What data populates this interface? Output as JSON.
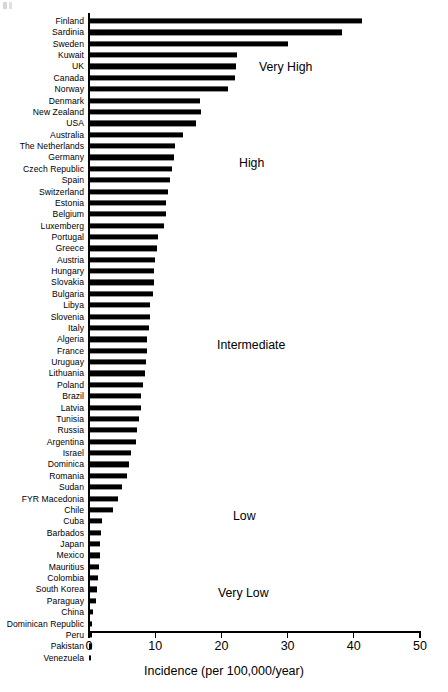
{
  "chart_data": {
    "type": "bar",
    "orientation": "horizontal",
    "title": "",
    "subtitle": "",
    "xlabel": "Incidence (per 100,000/year)",
    "ylabel": "",
    "xlim": [
      0,
      50
    ],
    "xticks": [
      0,
      10,
      20,
      30,
      40,
      50
    ],
    "xtick_labels": [
      "0",
      "10",
      "20",
      "30",
      "40",
      "50"
    ],
    "grid": false,
    "legend": "none",
    "bar_color": "#000000",
    "categories": [
      "Finland",
      "Sardinia",
      "Sweden",
      "Kuwait",
      "UK",
      "Canada",
      "Norway",
      "Denmark",
      "New Zealand",
      "USA",
      "Australia",
      "The Netherlands",
      "Germany",
      "Czech Republic",
      "Spain",
      "Switzerland",
      "Estonia",
      "Belgium",
      "Luxemberg",
      "Portugal",
      "Greece",
      "Austria",
      "Hungary",
      "Slovakia",
      "Bulgaria",
      "Libya",
      "Slovenia",
      "Italy",
      "Algeria",
      "France",
      "Uruguay",
      "Lithuania",
      "Poland",
      "Brazil",
      "Latvia",
      "Tunisia",
      "Russia",
      "Argentina",
      "Israel",
      "Dominica",
      "Romania",
      "Sudan",
      "FYR Macedonia",
      "Chile",
      "Cuba",
      "Barbados",
      "Japan",
      "Mexico",
      "Mauritius",
      "Colombia",
      "South Korea",
      "Paraguay",
      "China",
      "Dominican Republic",
      "Peru",
      "Pakistan",
      "Venezuela"
    ],
    "values": [
      41.2,
      38.2,
      30.1,
      22.4,
      22.2,
      22.0,
      21.0,
      16.8,
      16.9,
      16.2,
      14.2,
      13.0,
      12.9,
      12.5,
      12.2,
      11.9,
      11.6,
      11.6,
      11.3,
      10.4,
      10.3,
      9.9,
      9.8,
      9.8,
      9.6,
      9.2,
      9.2,
      9.0,
      8.8,
      8.8,
      8.6,
      8.5,
      8.2,
      7.9,
      7.8,
      7.5,
      7.2,
      7.1,
      6.4,
      6.1,
      5.8,
      5.0,
      4.4,
      3.6,
      2.0,
      1.8,
      1.7,
      1.6,
      1.5,
      1.4,
      1.2,
      1.1,
      0.6,
      0.5,
      0.5,
      0.4,
      0.25
    ],
    "annotations": [
      {
        "text": "Very High",
        "x_px": 259,
        "y_px": 60
      },
      {
        "text": "High",
        "x_px": 239,
        "y_px": 156
      },
      {
        "text": "Intermediate",
        "x_px": 217,
        "y_px": 338
      },
      {
        "text": "Low",
        "x_px": 233,
        "y_px": 509
      },
      {
        "text": "Very Low",
        "x_px": 218,
        "y_px": 586
      }
    ]
  }
}
